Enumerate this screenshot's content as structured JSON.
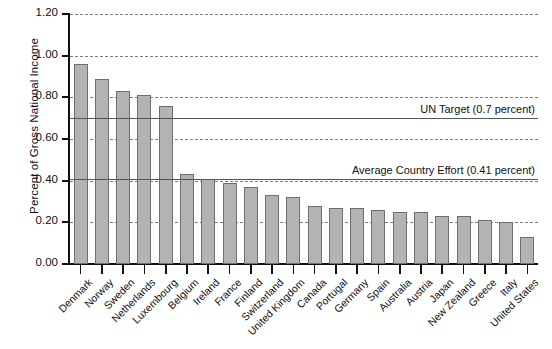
{
  "chart_data": {
    "type": "bar",
    "title": "",
    "xlabel": "",
    "ylabel": "Percent of Gross National Income",
    "ylim": [
      0.0,
      1.2
    ],
    "ytick_values": [
      0.0,
      0.2,
      0.4,
      0.6,
      0.8,
      1.0,
      1.2
    ],
    "ytick_labels": [
      "0.00",
      "0.20",
      "0.40",
      "0.60",
      "0.80",
      "1.00",
      "1.20"
    ],
    "grid": true,
    "legend": "none",
    "categories": [
      "Denmark",
      "Norway",
      "Sweden",
      "Netherlands",
      "Luxembourg",
      "Belgium",
      "Ireland",
      "France",
      "Finland",
      "Switzerland",
      "United Kingdom",
      "Canada",
      "Portugal",
      "Germany",
      "Spain",
      "Australia",
      "Austria",
      "Japan",
      "New Zealand",
      "Greece",
      "Italy",
      "United States"
    ],
    "values": [
      0.96,
      0.89,
      0.83,
      0.81,
      0.76,
      0.43,
      0.41,
      0.39,
      0.37,
      0.33,
      0.32,
      0.28,
      0.27,
      0.27,
      0.26,
      0.25,
      0.25,
      0.23,
      0.23,
      0.21,
      0.2,
      0.13
    ],
    "annotations": [
      {
        "label": "UN Target (0.7 percent)",
        "value": 0.7
      },
      {
        "label": "Average Country Effort (0.41 percent)",
        "value": 0.41
      }
    ],
    "colors": {
      "bar_fill": "#b3b3b3",
      "bar_edge": "#6e6e6e",
      "grid": "#7d7d7d",
      "axis": "#111111",
      "reference_line": "#555555",
      "background": "#ffffff"
    }
  }
}
